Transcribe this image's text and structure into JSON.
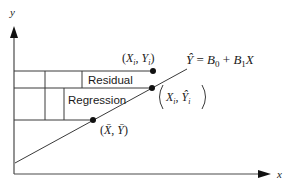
{
  "diagram": {
    "axes": {
      "y_label": "y",
      "x_label": "x"
    },
    "boxes": {
      "residual_label": "Residual",
      "regression_label": "Regression"
    },
    "points": {
      "observed": {
        "label_x": "X",
        "label_x_sub": "i",
        "label_sep": ", ",
        "label_y": "Y",
        "label_y_sub": "i",
        "open": "(",
        "close": ")"
      },
      "fitted": {
        "label_x": "X",
        "label_x_sub": "i",
        "label_sep": ", ",
        "label_y": "Ŷ",
        "label_y_sub": "i",
        "open": "(",
        "close": ")"
      },
      "mean": {
        "label_x": "X̄",
        "label_sep": ", ",
        "label_y": "Ȳ",
        "open": "(",
        "close": ")"
      }
    },
    "equation": {
      "lhs": "Ŷ",
      "eq": " = ",
      "b0": "B",
      "b0_sub": "0",
      "plus": " + ",
      "b1": "B",
      "b1_sub": "1",
      "var": "X"
    },
    "colors": {
      "line": "#3a3a3a",
      "point": "#111111",
      "background": "#ffffff"
    }
  }
}
